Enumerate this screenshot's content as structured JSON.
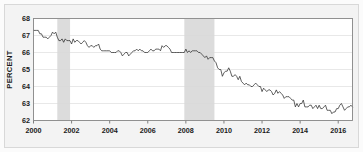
{
  "chart_data": {
    "type": "line",
    "title": "",
    "subtitle": "",
    "xlabel": "",
    "ylabel": "PERCENT",
    "xlim": [
      2000.0,
      2016.75
    ],
    "ylim": [
      62,
      68
    ],
    "yticks": [
      62,
      63,
      64,
      65,
      66,
      67,
      68
    ],
    "ytick_labels": [
      "62",
      "63",
      "64",
      "65",
      "66",
      "67",
      "68"
    ],
    "xticks": [
      2000,
      2002,
      2004,
      2006,
      2008,
      2010,
      2012,
      2014,
      2016
    ],
    "xtick_labels": [
      "2000",
      "2002",
      "2004",
      "2006",
      "2008",
      "2010",
      "2012",
      "2014",
      "2016"
    ],
    "grid": true,
    "grid_axis": "y",
    "legend": false,
    "legend_position": "none",
    "line_color": "#2b2b2b",
    "band_color": "#dcdcdc",
    "plot_background": "#ffffff",
    "figure_background": "#f3f3f3",
    "annotations": [
      {
        "name": "recession-band-2001",
        "x_start": 2001.25,
        "x_end": 2001.92
      },
      {
        "name": "recession-band-2008",
        "x_start": 2007.92,
        "x_end": 2009.5
      }
    ],
    "series": [
      {
        "name": "Labor Force Participation Rate",
        "x": [
          2000.0,
          2000.083,
          2000.167,
          2000.25,
          2000.333,
          2000.417,
          2000.5,
          2000.583,
          2000.667,
          2000.75,
          2000.833,
          2000.917,
          2001.0,
          2001.083,
          2001.167,
          2001.25,
          2001.333,
          2001.417,
          2001.5,
          2001.583,
          2001.667,
          2001.75,
          2001.833,
          2001.917,
          2002.0,
          2002.083,
          2002.167,
          2002.25,
          2002.333,
          2002.417,
          2002.5,
          2002.583,
          2002.667,
          2002.75,
          2002.833,
          2002.917,
          2003.0,
          2003.083,
          2003.167,
          2003.25,
          2003.333,
          2003.417,
          2003.5,
          2003.583,
          2003.667,
          2003.75,
          2003.833,
          2003.917,
          2004.0,
          2004.083,
          2004.167,
          2004.25,
          2004.333,
          2004.417,
          2004.5,
          2004.583,
          2004.667,
          2004.75,
          2004.833,
          2004.917,
          2005.0,
          2005.083,
          2005.167,
          2005.25,
          2005.333,
          2005.417,
          2005.5,
          2005.583,
          2005.667,
          2005.75,
          2005.833,
          2005.917,
          2006.0,
          2006.083,
          2006.167,
          2006.25,
          2006.333,
          2006.417,
          2006.5,
          2006.583,
          2006.667,
          2006.75,
          2006.833,
          2006.917,
          2007.0,
          2007.083,
          2007.167,
          2007.25,
          2007.333,
          2007.417,
          2007.5,
          2007.583,
          2007.667,
          2007.75,
          2007.833,
          2007.917,
          2008.0,
          2008.083,
          2008.167,
          2008.25,
          2008.333,
          2008.417,
          2008.5,
          2008.583,
          2008.667,
          2008.75,
          2008.833,
          2008.917,
          2009.0,
          2009.083,
          2009.167,
          2009.25,
          2009.333,
          2009.417,
          2009.5,
          2009.583,
          2009.667,
          2009.75,
          2009.833,
          2009.917,
          2010.0,
          2010.083,
          2010.167,
          2010.25,
          2010.333,
          2010.417,
          2010.5,
          2010.583,
          2010.667,
          2010.75,
          2010.833,
          2010.917,
          2011.0,
          2011.083,
          2011.167,
          2011.25,
          2011.333,
          2011.417,
          2011.5,
          2011.583,
          2011.667,
          2011.75,
          2011.833,
          2011.917,
          2012.0,
          2012.083,
          2012.167,
          2012.25,
          2012.333,
          2012.417,
          2012.5,
          2012.583,
          2012.667,
          2012.75,
          2012.833,
          2012.917,
          2013.0,
          2013.083,
          2013.167,
          2013.25,
          2013.333,
          2013.417,
          2013.5,
          2013.583,
          2013.667,
          2013.75,
          2013.833,
          2013.917,
          2014.0,
          2014.083,
          2014.167,
          2014.25,
          2014.333,
          2014.417,
          2014.5,
          2014.583,
          2014.667,
          2014.75,
          2014.833,
          2014.917,
          2015.0,
          2015.083,
          2015.167,
          2015.25,
          2015.333,
          2015.417,
          2015.5,
          2015.583,
          2015.667,
          2015.75,
          2015.833,
          2015.917,
          2016.0,
          2016.083,
          2016.167,
          2016.25,
          2016.333,
          2016.417,
          2016.5,
          2016.583,
          2016.667,
          2016.75
        ],
        "values": [
          67.3,
          67.3,
          67.3,
          67.3,
          67.1,
          67.1,
          66.9,
          66.9,
          66.9,
          66.8,
          66.9,
          67.0,
          67.2,
          67.1,
          67.2,
          66.9,
          66.7,
          66.7,
          66.8,
          66.6,
          66.8,
          66.7,
          66.7,
          66.7,
          66.5,
          66.8,
          66.6,
          66.7,
          66.7,
          66.6,
          66.5,
          66.6,
          66.7,
          66.6,
          66.4,
          66.3,
          66.4,
          66.4,
          66.3,
          66.4,
          66.4,
          66.5,
          66.2,
          66.1,
          66.1,
          66.1,
          66.1,
          66.1,
          66.1,
          66.0,
          66.0,
          66.0,
          66.0,
          66.1,
          66.1,
          66.0,
          65.8,
          65.9,
          66.0,
          66.0,
          65.8,
          65.9,
          66.0,
          66.1,
          66.1,
          66.2,
          66.1,
          66.2,
          66.1,
          66.1,
          66.0,
          66.0,
          66.0,
          66.1,
          66.2,
          66.1,
          66.1,
          66.2,
          66.2,
          66.2,
          66.1,
          66.4,
          66.3,
          66.4,
          66.4,
          66.3,
          66.2,
          66.0,
          66.0,
          66.0,
          66.0,
          66.0,
          66.0,
          66.0,
          66.0,
          66.0,
          66.2,
          66.0,
          66.1,
          66.0,
          66.1,
          66.1,
          66.1,
          66.1,
          66.0,
          66.0,
          65.9,
          65.8,
          65.7,
          65.8,
          65.6,
          65.7,
          65.7,
          65.7,
          65.5,
          65.4,
          65.1,
          65.0,
          65.0,
          64.6,
          64.8,
          64.9,
          64.9,
          65.1,
          64.9,
          64.6,
          64.6,
          64.7,
          64.6,
          64.4,
          64.6,
          64.3,
          64.2,
          64.1,
          64.2,
          64.1,
          64.1,
          64.0,
          64.0,
          64.1,
          64.2,
          64.1,
          64.0,
          64.0,
          63.7,
          63.9,
          63.8,
          63.7,
          63.8,
          63.8,
          63.7,
          63.5,
          63.6,
          63.8,
          63.6,
          63.7,
          63.6,
          63.5,
          63.3,
          63.4,
          63.4,
          63.4,
          63.3,
          63.2,
          63.2,
          62.8,
          63.0,
          62.8,
          63.0,
          63.0,
          63.2,
          62.8,
          62.8,
          62.8,
          62.9,
          62.9,
          62.7,
          62.8,
          62.9,
          62.7,
          62.9,
          62.7,
          62.7,
          62.8,
          62.9,
          62.6,
          62.6,
          62.6,
          62.4,
          62.5,
          62.5,
          62.7,
          62.7,
          62.9,
          63.0,
          62.8,
          62.6,
          62.7,
          62.8,
          62.8,
          62.9,
          62.8
        ]
      }
    ]
  }
}
